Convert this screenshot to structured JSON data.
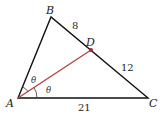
{
  "diagram": {
    "type": "triangle-angle-bisector",
    "vertices": {
      "A": {
        "label": "A",
        "x": 18,
        "y": 98
      },
      "B": {
        "label": "B",
        "x": 51,
        "y": 17
      },
      "C": {
        "label": "C",
        "x": 148,
        "y": 98
      },
      "D": {
        "label": "D",
        "x": 91,
        "y": 50
      }
    },
    "segments": {
      "BD": "8",
      "DC": "12",
      "AC": "21"
    },
    "angle_labels": [
      "θ",
      "θ"
    ],
    "colors": {
      "triangle": "#111111",
      "bisector": "#b5413a",
      "point": "#9e2a2a"
    }
  }
}
